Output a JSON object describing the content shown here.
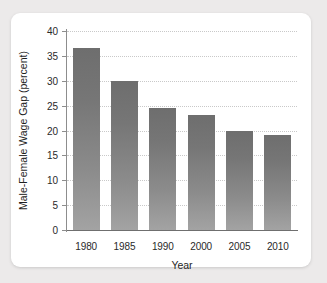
{
  "chart_data": {
    "type": "bar",
    "title": "",
    "xlabel": "Year",
    "ylabel": "Male-Female Wage Gap (percent)",
    "categories": [
      "1980",
      "1985",
      "1990",
      "2000",
      "2005",
      "2010"
    ],
    "values": [
      36.5,
      30.0,
      24.5,
      23.2,
      19.9,
      19.1
    ],
    "ylim": [
      0,
      40
    ],
    "yticks": [
      0,
      5,
      10,
      15,
      20,
      25,
      30,
      35,
      40
    ],
    "ytick_labels": [
      "0",
      "5",
      "10",
      "15",
      "20",
      "25",
      "30",
      "35",
      "40"
    ],
    "grid": "horizontal-dotted",
    "legend": "none",
    "bar_color_top": "#6e6e6e",
    "bar_color_bottom": "#a3a3a3",
    "gridline_color": "#c9c9c9",
    "axis_color": "#6f6f6f",
    "card_background": "#ffffff",
    "page_background": "#eceaea"
  }
}
